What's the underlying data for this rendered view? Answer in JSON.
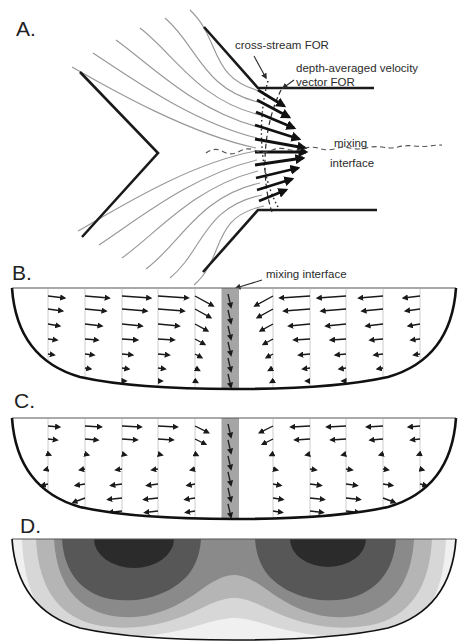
{
  "figure": {
    "background": "#ffffff",
    "panels": {
      "a": {
        "label": "A.",
        "description": "plan view of channel confluence with streamlines and depth-averaged velocity vectors",
        "annotations": {
          "cross_stream": "cross-stream FOR",
          "depth_avg_line1": "depth-averaged velocity",
          "depth_avg_line2": "vector FOR",
          "mixing_line1": "mixing",
          "mixing_line2": "interface"
        },
        "streamline_color": "#989898",
        "bank_color": "#1a1a1a"
      },
      "b": {
        "label": "B.",
        "annotation": "mixing interface",
        "flow_pattern": "convergent_all_depths"
      },
      "c": {
        "label": "C.",
        "flow_pattern": "surface_convergent_bed_divergent"
      },
      "d": {
        "label": "D.",
        "contour_colors": [
          "#f0f0f0",
          "#d7d7d7",
          "#b5b5b5",
          "#8a8a8a",
          "#575757",
          "#2b2b2b"
        ]
      }
    },
    "field_colors": {
      "arrow": "#1a1a1a",
      "profile_line": "#cccccc",
      "interface_band": "#a5a5a5"
    }
  }
}
